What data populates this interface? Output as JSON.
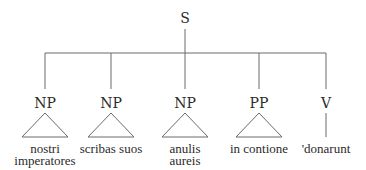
{
  "diagram": {
    "type": "syntax-tree",
    "root": {
      "label": "S",
      "x": 185
    },
    "bar_y": 53,
    "colors": {
      "line": "#6a6a6a",
      "text": "#2a2a2a",
      "background": "#ffffff"
    },
    "children": [
      {
        "label": "NP",
        "x": 45,
        "shape": "triangle",
        "leaf": [
          "nostri",
          "imperatores"
        ]
      },
      {
        "label": "NP",
        "x": 111,
        "shape": "triangle",
        "leaf": [
          "scribas suos"
        ]
      },
      {
        "label": "NP",
        "x": 185,
        "shape": "triangle",
        "leaf": [
          "anulis",
          "aureis"
        ]
      },
      {
        "label": "PP",
        "x": 259,
        "shape": "triangle",
        "leaf": [
          "in contione"
        ]
      },
      {
        "label": "V",
        "x": 326,
        "shape": "line",
        "leaf": [
          "'donarunt"
        ]
      }
    ]
  }
}
